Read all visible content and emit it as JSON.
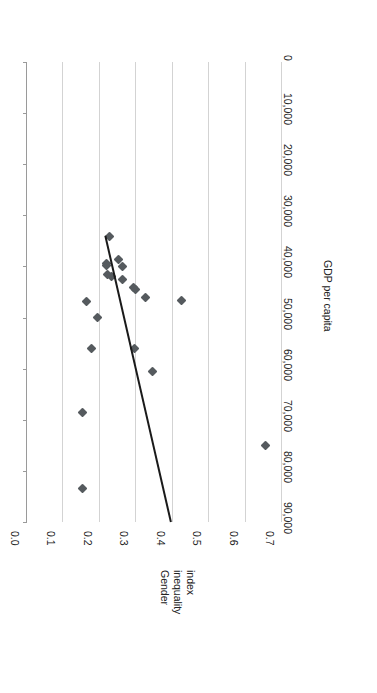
{
  "chart_data": {
    "type": "scatter",
    "title": "",
    "xlabel": "GDP per capita",
    "ylabel": "Gender inequality index",
    "orientation": "rotated-90-ccw",
    "xlim": [
      0,
      90000
    ],
    "ylim": [
      0.0,
      0.7
    ],
    "xticks": [
      "0",
      "10,000",
      "20,000",
      "30,000",
      "40,000",
      "50,000",
      "60,000",
      "70,000",
      "80,000",
      "90,000"
    ],
    "xtick_values": [
      0,
      10000,
      20000,
      30000,
      40000,
      50000,
      60000,
      70000,
      80000,
      90000
    ],
    "yticks": [
      "0.7",
      "0.6",
      "0.5",
      "0.4",
      "0.3",
      "0.2",
      "0.1",
      "0.0"
    ],
    "ytick_values": [
      0.7,
      0.6,
      0.5,
      0.4,
      0.3,
      0.2,
      0.1,
      0.0
    ],
    "y_axis_inverted": true,
    "grid": "y-gridlines-only",
    "legend": "none",
    "marker": {
      "shape": "diamond",
      "color": "#555a5e",
      "size": 7
    },
    "trendline": {
      "visible": true,
      "color": "#1a1a1a",
      "width": 2,
      "x_start": 90000,
      "y_start": 0.395,
      "x_end": 34000,
      "y_end": 0.215
    },
    "points": [
      {
        "x": 75000,
        "y": 0.655
      },
      {
        "x": 46600,
        "y": 0.425
      },
      {
        "x": 83500,
        "y": 0.152
      },
      {
        "x": 68500,
        "y": 0.152
      },
      {
        "x": 60500,
        "y": 0.345
      },
      {
        "x": 56000,
        "y": 0.295
      },
      {
        "x": 56000,
        "y": 0.178
      },
      {
        "x": 50000,
        "y": 0.193
      },
      {
        "x": 46800,
        "y": 0.163
      },
      {
        "x": 46000,
        "y": 0.325
      },
      {
        "x": 44600,
        "y": 0.298
      },
      {
        "x": 44200,
        "y": 0.292
      },
      {
        "x": 42500,
        "y": 0.262
      },
      {
        "x": 42000,
        "y": 0.232
      },
      {
        "x": 41500,
        "y": 0.222
      },
      {
        "x": 40000,
        "y": 0.262
      },
      {
        "x": 39800,
        "y": 0.219
      },
      {
        "x": 39500,
        "y": 0.218
      },
      {
        "x": 38600,
        "y": 0.251
      },
      {
        "x": 34200,
        "y": 0.227
      }
    ]
  },
  "axes": {
    "x_title": "GDP per capita",
    "y_title_lines": [
      "Gender",
      "inequality",
      "index"
    ]
  }
}
